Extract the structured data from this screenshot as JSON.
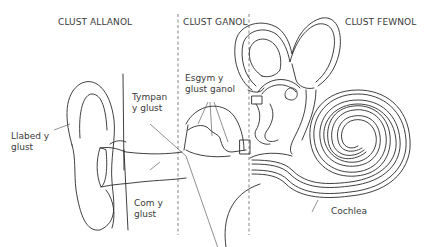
{
  "diagram": {
    "sections": [
      {
        "id": "outer",
        "label": "CLUST ALLANOL"
      },
      {
        "id": "middle",
        "label": "CLUST GANOL"
      },
      {
        "id": "inner",
        "label": "CLUST FEWNOL"
      }
    ],
    "labels": {
      "pinna": "Llabed y\nglust",
      "eardrum": "Tympan\ny glust",
      "ear_canal": "Com y\nglust",
      "ossicles": "Esgym y\nglust ganol",
      "cochlea": "Cochlea"
    },
    "colors": {
      "line": "#2a2a2a",
      "text": "#3a3a3a",
      "divider": "#777777",
      "background": "#ffffff"
    }
  }
}
